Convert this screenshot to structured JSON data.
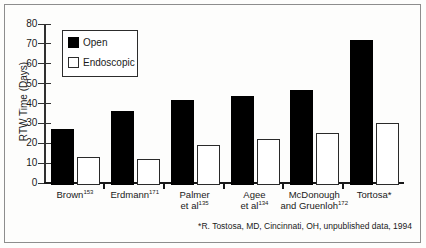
{
  "chart_data": {
    "type": "bar",
    "title": "",
    "xlabel": "",
    "ylabel": "RTW Time (Days)",
    "ylim": [
      0,
      80
    ],
    "yticks": [
      0,
      10,
      20,
      30,
      40,
      50,
      60,
      70,
      80
    ],
    "grid": false,
    "legend_position": "upper-left-inside",
    "categories": [
      "Brown153",
      "Erdmann171",
      "Palmer et al135",
      "Agee et al134",
      "McDonough and Gruenloh172",
      "Tortosa*"
    ],
    "series": [
      {
        "name": "Open",
        "color": "#000000",
        "values": [
          28,
          37,
          43,
          45,
          48,
          73
        ]
      },
      {
        "name": "Endoscopic",
        "color": "#ffffff",
        "values": [
          14,
          13,
          20,
          23,
          26,
          31
        ]
      }
    ],
    "annotations": [
      "*R. Tostosa, MD, Cincinnati, OH, unpublished data, 1994"
    ]
  },
  "axis": {
    "y_title": "RTW Time (Days)",
    "y_ticks": [
      "0",
      "10",
      "20",
      "30",
      "40",
      "50",
      "60",
      "70",
      "80"
    ]
  },
  "legend": {
    "open_label": "Open",
    "endoscopic_label": "Endoscopic"
  },
  "x_labels": [
    {
      "line1": "Brown",
      "sup1": "153",
      "line2": "",
      "sup2": ""
    },
    {
      "line1": "Erdmann",
      "sup1": "171",
      "line2": "",
      "sup2": ""
    },
    {
      "line1": "Palmer",
      "sup1": "",
      "line2": "et al",
      "sup2": "135"
    },
    {
      "line1": "Agee",
      "sup1": "",
      "line2": "et al",
      "sup2": "134"
    },
    {
      "line1": "McDonough",
      "sup1": "",
      "line2": "and Gruenloh",
      "sup2": "172"
    },
    {
      "line1": "Tortosa*",
      "sup1": "",
      "line2": "",
      "sup2": ""
    }
  ],
  "footnote": "*R. Tostosa, MD, Cincinnati, OH, unpublished data, 1994"
}
